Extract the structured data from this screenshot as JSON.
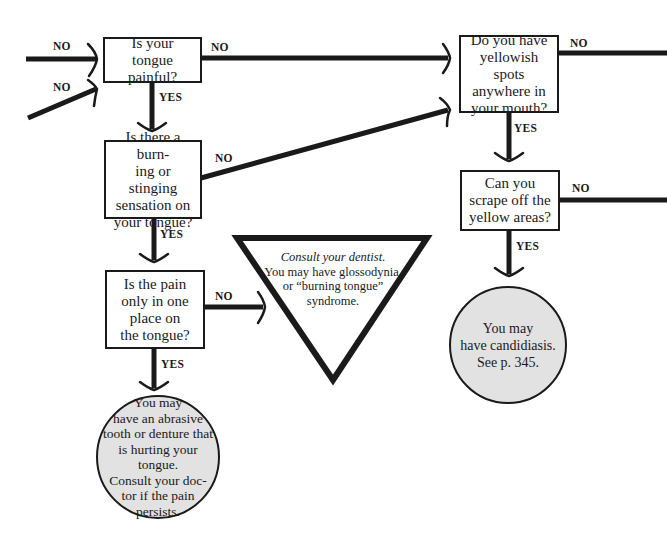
{
  "diagram": {
    "type": "flowchart",
    "topic": "Tongue pain symptom chart",
    "nodes": {
      "q_tongue_painful": {
        "text": "Is your tongue painful?"
      },
      "q_burning": {
        "text": "Is there a burning or stinging sensation on your tongue?"
      },
      "q_one_place": {
        "text": "Is the pain only in one place on the tongue?"
      },
      "q_yellow_spots": {
        "text": "Do you have yellowish spots anywhere in your mouth?"
      },
      "q_scrape": {
        "text": "Can you scrape off the yellow areas?"
      },
      "r_abrasive": {
        "text": "You may have an abrasive tooth or denture that is hurting your tongue. Consult your doctor if the pain persists."
      },
      "r_glossodynia": {
        "emphasis": "Consult your dentist.",
        "text": "You may have glossodynia, or “burning tongue” syndrome."
      },
      "r_candidiasis": {
        "text": "You may have candidiasis. See p. 345."
      }
    },
    "labels": {
      "no": "NO",
      "yes": "YES"
    },
    "edges": [
      {
        "from": "incoming-left-1",
        "to": "q_tongue_painful",
        "label": "NO"
      },
      {
        "from": "incoming-left-2",
        "to": "q_tongue_painful",
        "label": "NO"
      },
      {
        "from": "q_tongue_painful",
        "to": "q_yellow_spots",
        "label": "NO"
      },
      {
        "from": "q_tongue_painful",
        "to": "q_burning",
        "label": "YES"
      },
      {
        "from": "q_burning",
        "to": "q_yellow_spots",
        "label": "NO"
      },
      {
        "from": "q_burning",
        "to": "q_one_place",
        "label": "YES"
      },
      {
        "from": "q_one_place",
        "to": "r_glossodynia",
        "label": "NO"
      },
      {
        "from": "q_one_place",
        "to": "r_abrasive",
        "label": "YES"
      },
      {
        "from": "q_yellow_spots",
        "to": "outgoing-right-1",
        "label": "NO"
      },
      {
        "from": "q_yellow_spots",
        "to": "q_scrape",
        "label": "YES"
      },
      {
        "from": "q_scrape",
        "to": "outgoing-right-2",
        "label": "NO"
      },
      {
        "from": "q_scrape",
        "to": "r_candidiasis",
        "label": "YES"
      }
    ]
  },
  "text": {
    "box1": [
      "Is your",
      "tongue painful?"
    ],
    "box2": [
      "Is there a burn-",
      "ing or stinging",
      "sensation on",
      "your tongue?"
    ],
    "box3": [
      "Is the pain",
      "only in one",
      "place on",
      "the tongue?"
    ],
    "box4": [
      "Do you have",
      "yellowish spots",
      "anywhere in",
      "your mouth?"
    ],
    "box5": [
      "Can you",
      "scrape off the",
      "yellow areas?"
    ],
    "circle1": [
      "You may",
      "have an abrasive",
      "tooth or denture that",
      "is hurting your tongue.",
      "Consult your doc-",
      "tor if the pain",
      "persists."
    ],
    "triangle": {
      "emphasis": "Consult your dentist.",
      "lines": [
        "You may have glossodynia,",
        "or “burning tongue”",
        "syndrome."
      ]
    },
    "circle2": [
      "You may",
      "have candidiasis.",
      "See p. 345."
    ]
  },
  "colors": {
    "line": "#1a1a1a",
    "result_fill": "#e2e2e2",
    "background": "#ffffff"
  }
}
